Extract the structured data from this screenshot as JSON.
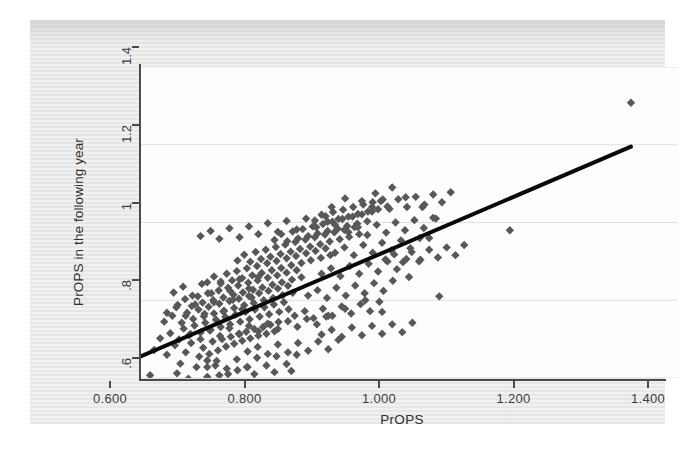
{
  "chart_data": {
    "type": "scatter",
    "title": "",
    "xlabel": "PrOPS",
    "ylabel": "PrOPS in the following year",
    "xlim": [
      0.6,
      1.4
    ],
    "ylim": [
      0.6,
      1.4
    ],
    "grid": true,
    "legend": null,
    "xticks": [
      0.6,
      0.8,
      1.0,
      1.2,
      1.4
    ],
    "xticklabels": [
      "0.600",
      "0.800",
      "1.000",
      "1.200",
      "1.400"
    ],
    "yticks": [
      0.6,
      0.8,
      1.0,
      1.2,
      1.4
    ],
    "yticklabels": [
      ".6",
      ".8",
      "1",
      "1.2",
      "1.4"
    ],
    "marker": "diamond",
    "marker_color": "#58585a",
    "marker_size": 4.2,
    "fit_line": {
      "name": "linear fit",
      "color": "#0a0a0a",
      "width": 4.0,
      "x0": 0.6,
      "y0": 0.655,
      "x1": 1.33,
      "y1": 1.195,
      "slope": 0.7397,
      "intercept": 0.2112
    },
    "points": [
      [
        0.615,
        0.607
      ],
      [
        0.672,
        0.598
      ],
      [
        0.718,
        0.607
      ],
      [
        0.731,
        0.61
      ],
      [
        0.66,
        0.637
      ],
      [
        0.684,
        0.628
      ],
      [
        0.7,
        0.645
      ],
      [
        0.712,
        0.632
      ],
      [
        0.745,
        0.62
      ],
      [
        0.76,
        0.628
      ],
      [
        0.621,
        0.672
      ],
      [
        0.64,
        0.66
      ],
      [
        0.652,
        0.684
      ],
      [
        0.668,
        0.666
      ],
      [
        0.676,
        0.69
      ],
      [
        0.688,
        0.655
      ],
      [
        0.694,
        0.678
      ],
      [
        0.703,
        0.662
      ],
      [
        0.708,
        0.694
      ],
      [
        0.716,
        0.671
      ],
      [
        0.722,
        0.7
      ],
      [
        0.728,
        0.681
      ],
      [
        0.735,
        0.706
      ],
      [
        0.74,
        0.688
      ],
      [
        0.748,
        0.713
      ],
      [
        0.752,
        0.696
      ],
      [
        0.758,
        0.719
      ],
      [
        0.764,
        0.702
      ],
      [
        0.77,
        0.726
      ],
      [
        0.776,
        0.709
      ],
      [
        0.783,
        0.731
      ],
      [
        0.788,
        0.714
      ],
      [
        0.794,
        0.737
      ],
      [
        0.8,
        0.72
      ],
      [
        0.806,
        0.744
      ],
      [
        0.63,
        0.702
      ],
      [
        0.645,
        0.715
      ],
      [
        0.658,
        0.699
      ],
      [
        0.665,
        0.727
      ],
      [
        0.673,
        0.71
      ],
      [
        0.681,
        0.735
      ],
      [
        0.69,
        0.717
      ],
      [
        0.697,
        0.742
      ],
      [
        0.705,
        0.724
      ],
      [
        0.713,
        0.75
      ],
      [
        0.72,
        0.731
      ],
      [
        0.727,
        0.757
      ],
      [
        0.734,
        0.738
      ],
      [
        0.742,
        0.763
      ],
      [
        0.749,
        0.745
      ],
      [
        0.757,
        0.77
      ],
      [
        0.763,
        0.751
      ],
      [
        0.771,
        0.776
      ],
      [
        0.778,
        0.758
      ],
      [
        0.785,
        0.782
      ],
      [
        0.792,
        0.764
      ],
      [
        0.799,
        0.789
      ],
      [
        0.807,
        0.77
      ],
      [
        0.814,
        0.795
      ],
      [
        0.821,
        0.777
      ],
      [
        0.636,
        0.745
      ],
      [
        0.648,
        0.76
      ],
      [
        0.662,
        0.742
      ],
      [
        0.67,
        0.768
      ],
      [
        0.679,
        0.752
      ],
      [
        0.687,
        0.776
      ],
      [
        0.695,
        0.759
      ],
      [
        0.702,
        0.783
      ],
      [
        0.71,
        0.766
      ],
      [
        0.718,
        0.791
      ],
      [
        0.725,
        0.773
      ],
      [
        0.733,
        0.798
      ],
      [
        0.74,
        0.78
      ],
      [
        0.747,
        0.804
      ],
      [
        0.755,
        0.787
      ],
      [
        0.762,
        0.811
      ],
      [
        0.769,
        0.793
      ],
      [
        0.777,
        0.818
      ],
      [
        0.784,
        0.8
      ],
      [
        0.791,
        0.824
      ],
      [
        0.798,
        0.806
      ],
      [
        0.805,
        0.83
      ],
      [
        0.812,
        0.813
      ],
      [
        0.82,
        0.837
      ],
      [
        0.827,
        0.819
      ],
      [
        0.656,
        0.788
      ],
      [
        0.667,
        0.803
      ],
      [
        0.677,
        0.785
      ],
      [
        0.686,
        0.81
      ],
      [
        0.693,
        0.794
      ],
      [
        0.701,
        0.818
      ],
      [
        0.709,
        0.8
      ],
      [
        0.717,
        0.825
      ],
      [
        0.724,
        0.807
      ],
      [
        0.731,
        0.832
      ],
      [
        0.739,
        0.814
      ],
      [
        0.746,
        0.838
      ],
      [
        0.753,
        0.82
      ],
      [
        0.761,
        0.845
      ],
      [
        0.768,
        0.827
      ],
      [
        0.775,
        0.851
      ],
      [
        0.782,
        0.833
      ],
      [
        0.79,
        0.858
      ],
      [
        0.797,
        0.84
      ],
      [
        0.804,
        0.864
      ],
      [
        0.811,
        0.846
      ],
      [
        0.818,
        0.871
      ],
      [
        0.826,
        0.853
      ],
      [
        0.833,
        0.877
      ],
      [
        0.84,
        0.859
      ],
      [
        0.7,
        0.846
      ],
      [
        0.71,
        0.861
      ],
      [
        0.72,
        0.843
      ],
      [
        0.729,
        0.868
      ],
      [
        0.737,
        0.851
      ],
      [
        0.744,
        0.875
      ],
      [
        0.752,
        0.857
      ],
      [
        0.759,
        0.882
      ],
      [
        0.767,
        0.864
      ],
      [
        0.774,
        0.888
      ],
      [
        0.781,
        0.87
      ],
      [
        0.789,
        0.895
      ],
      [
        0.796,
        0.877
      ],
      [
        0.803,
        0.901
      ],
      [
        0.81,
        0.883
      ],
      [
        0.818,
        0.908
      ],
      [
        0.825,
        0.89
      ],
      [
        0.832,
        0.914
      ],
      [
        0.84,
        0.896
      ],
      [
        0.847,
        0.921
      ],
      [
        0.854,
        0.903
      ],
      [
        0.861,
        0.927
      ],
      [
        0.869,
        0.909
      ],
      [
        0.876,
        0.933
      ],
      [
        0.883,
        0.916
      ],
      [
        0.745,
        0.902
      ],
      [
        0.755,
        0.917
      ],
      [
        0.764,
        0.899
      ],
      [
        0.772,
        0.924
      ],
      [
        0.78,
        0.906
      ],
      [
        0.787,
        0.93
      ],
      [
        0.794,
        0.912
      ],
      [
        0.802,
        0.937
      ],
      [
        0.809,
        0.919
      ],
      [
        0.816,
        0.943
      ],
      [
        0.824,
        0.925
      ],
      [
        0.831,
        0.95
      ],
      [
        0.838,
        0.932
      ],
      [
        0.846,
        0.956
      ],
      [
        0.853,
        0.938
      ],
      [
        0.86,
        0.962
      ],
      [
        0.868,
        0.944
      ],
      [
        0.875,
        0.969
      ],
      [
        0.882,
        0.951
      ],
      [
        0.889,
        0.975
      ],
      [
        0.897,
        0.957
      ],
      [
        0.904,
        0.981
      ],
      [
        0.911,
        0.963
      ],
      [
        0.919,
        0.988
      ],
      [
        0.926,
        0.97
      ],
      [
        0.8,
        0.955
      ],
      [
        0.81,
        0.97
      ],
      [
        0.819,
        0.952
      ],
      [
        0.827,
        0.977
      ],
      [
        0.835,
        0.959
      ],
      [
        0.842,
        0.983
      ],
      [
        0.85,
        0.965
      ],
      [
        0.857,
        0.99
      ],
      [
        0.864,
        0.972
      ],
      [
        0.872,
        0.996
      ],
      [
        0.879,
        0.978
      ],
      [
        0.886,
        1.002
      ],
      [
        0.894,
        0.984
      ],
      [
        0.901,
        1.009
      ],
      [
        0.908,
        0.991
      ],
      [
        0.916,
        1.015
      ],
      [
        0.923,
        0.997
      ],
      [
        0.93,
        1.021
      ],
      [
        0.938,
        1.003
      ],
      [
        0.945,
        1.028
      ],
      [
        0.86,
        1.005
      ],
      [
        0.87,
        1.02
      ],
      [
        0.879,
        1.002
      ],
      [
        0.887,
        1.027
      ],
      [
        0.895,
        1.009
      ],
      [
        0.902,
        1.033
      ],
      [
        0.91,
        1.015
      ],
      [
        0.917,
        1.04
      ],
      [
        0.924,
        1.022
      ],
      [
        0.932,
        1.046
      ],
      [
        0.939,
        1.028
      ],
      [
        0.946,
        1.052
      ],
      [
        0.954,
        1.034
      ],
      [
        0.961,
        1.059
      ],
      [
        0.968,
        1.041
      ],
      [
        0.69,
        0.965
      ],
      [
        0.705,
        0.978
      ],
      [
        0.718,
        0.958
      ],
      [
        0.733,
        0.985
      ],
      [
        0.748,
        0.962
      ],
      [
        0.762,
        0.99
      ],
      [
        0.776,
        0.97
      ],
      [
        0.79,
        0.998
      ],
      [
        0.805,
        0.976
      ],
      [
        0.818,
        1.004
      ],
      [
        0.833,
        0.982
      ],
      [
        0.847,
        1.01
      ],
      [
        0.862,
        0.988
      ],
      [
        0.876,
        1.016
      ],
      [
        0.89,
        0.994
      ],
      [
        0.65,
        0.82
      ],
      [
        0.664,
        0.835
      ],
      [
        0.678,
        0.812
      ],
      [
        0.692,
        0.842
      ],
      [
        0.706,
        0.818
      ],
      [
        0.72,
        0.848
      ],
      [
        0.734,
        0.824
      ],
      [
        0.748,
        0.854
      ],
      [
        0.762,
        0.83
      ],
      [
        0.776,
        0.86
      ],
      [
        0.64,
        0.768
      ],
      [
        0.654,
        0.782
      ],
      [
        0.668,
        0.76
      ],
      [
        0.682,
        0.789
      ],
      [
        0.696,
        0.765
      ],
      [
        0.71,
        0.795
      ],
      [
        0.724,
        0.771
      ],
      [
        0.738,
        0.801
      ],
      [
        0.752,
        0.777
      ],
      [
        0.766,
        0.807
      ],
      [
        0.675,
        0.713
      ],
      [
        0.69,
        0.7
      ],
      [
        0.704,
        0.722
      ],
      [
        0.719,
        0.708
      ],
      [
        0.733,
        0.728
      ],
      [
        0.747,
        0.714
      ],
      [
        0.762,
        0.734
      ],
      [
        0.776,
        0.72
      ],
      [
        0.79,
        0.74
      ],
      [
        0.805,
        0.726
      ],
      [
        0.82,
        0.746
      ],
      [
        0.834,
        0.732
      ],
      [
        0.848,
        0.752
      ],
      [
        0.863,
        0.738
      ],
      [
        0.877,
        0.758
      ],
      [
        0.83,
        0.76
      ],
      [
        0.845,
        0.772
      ],
      [
        0.858,
        0.754
      ],
      [
        0.872,
        0.778
      ],
      [
        0.886,
        0.76
      ],
      [
        0.9,
        0.784
      ],
      [
        0.914,
        0.766
      ],
      [
        0.928,
        0.79
      ],
      [
        0.942,
        0.772
      ],
      [
        0.956,
        0.796
      ],
      [
        0.85,
        0.812
      ],
      [
        0.864,
        0.826
      ],
      [
        0.878,
        0.806
      ],
      [
        0.892,
        0.832
      ],
      [
        0.906,
        0.812
      ],
      [
        0.92,
        0.838
      ],
      [
        0.934,
        0.818
      ],
      [
        0.948,
        0.844
      ],
      [
        0.962,
        0.824
      ],
      [
        0.976,
        0.85
      ],
      [
        0.87,
        0.868
      ],
      [
        0.884,
        0.882
      ],
      [
        0.898,
        0.862
      ],
      [
        0.912,
        0.888
      ],
      [
        0.926,
        0.868
      ],
      [
        0.94,
        0.894
      ],
      [
        0.954,
        0.874
      ],
      [
        0.968,
        0.9
      ],
      [
        0.982,
        0.88
      ],
      [
        0.996,
        0.906
      ],
      [
        0.89,
        0.922
      ],
      [
        0.904,
        0.936
      ],
      [
        0.918,
        0.916
      ],
      [
        0.932,
        0.942
      ],
      [
        0.946,
        0.922
      ],
      [
        0.96,
        0.948
      ],
      [
        0.974,
        0.928
      ],
      [
        0.988,
        0.954
      ],
      [
        1.002,
        0.934
      ],
      [
        1.016,
        0.96
      ],
      [
        0.91,
        0.975
      ],
      [
        0.924,
        0.988
      ],
      [
        0.938,
        0.968
      ],
      [
        0.952,
        0.994
      ],
      [
        0.966,
        0.974
      ],
      [
        0.98,
        1.0
      ],
      [
        0.994,
        0.98
      ],
      [
        1.008,
        1.006
      ],
      [
        1.022,
        0.986
      ],
      [
        1.036,
        1.012
      ],
      [
        0.945,
        1.04
      ],
      [
        0.958,
        1.055
      ],
      [
        0.971,
        1.035
      ],
      [
        0.984,
        1.06
      ],
      [
        0.997,
        1.04
      ],
      [
        1.01,
        1.066
      ],
      [
        1.023,
        1.046
      ],
      [
        1.036,
        1.072
      ],
      [
        1.049,
        1.052
      ],
      [
        1.062,
        1.078
      ],
      [
        0.965,
        0.905
      ],
      [
        0.978,
        0.918
      ],
      [
        0.991,
        0.898
      ],
      [
        1.004,
        0.924
      ],
      [
        1.017,
        0.904
      ],
      [
        1.03,
        0.93
      ],
      [
        1.043,
        0.91
      ],
      [
        1.056,
        0.936
      ],
      [
        1.069,
        0.916
      ],
      [
        1.082,
        0.942
      ],
      [
        0.7,
        0.628
      ],
      [
        0.714,
        0.644
      ],
      [
        0.729,
        0.624
      ],
      [
        0.744,
        0.648
      ],
      [
        0.759,
        0.628
      ],
      [
        0.774,
        0.652
      ],
      [
        0.788,
        0.632
      ],
      [
        0.803,
        0.656
      ],
      [
        0.818,
        0.636
      ],
      [
        0.833,
        0.66
      ],
      [
        0.76,
        0.668
      ],
      [
        0.775,
        0.68
      ],
      [
        0.79,
        0.662
      ],
      [
        0.805,
        0.686
      ],
      [
        0.82,
        0.666
      ],
      [
        0.835,
        0.69
      ],
      [
        0.85,
        0.67
      ],
      [
        0.865,
        0.694
      ],
      [
        0.88,
        0.674
      ],
      [
        0.895,
        0.698
      ],
      [
        0.87,
        0.712
      ],
      [
        0.885,
        0.724
      ],
      [
        0.9,
        0.706
      ],
      [
        0.915,
        0.73
      ],
      [
        0.93,
        0.71
      ],
      [
        0.945,
        0.734
      ],
      [
        0.96,
        0.714
      ],
      [
        0.975,
        0.738
      ],
      [
        0.99,
        0.718
      ],
      [
        1.005,
        0.742
      ],
      [
        1.045,
        0.81
      ],
      [
        1.15,
        0.98
      ],
      [
        1.3,
        1.42
      ],
      [
        1.33,
        1.308
      ],
      [
        0.77,
        0.61
      ],
      [
        0.8,
        0.615
      ],
      [
        0.825,
        0.618
      ],
      [
        0.7,
        0.603
      ],
      [
        0.655,
        0.612
      ],
      [
        0.88,
        0.76
      ],
      [
        0.905,
        0.778
      ],
      [
        0.935,
        0.8
      ],
      [
        0.96,
        0.77
      ],
      [
        1.0,
        0.86
      ],
      [
        1.015,
        0.9
      ],
      [
        1.03,
        0.96
      ],
      [
        1.04,
        1.01
      ],
      [
        1.02,
        1.04
      ],
      [
        0.995,
        1.065
      ],
      [
        0.975,
        1.09
      ],
      [
        0.95,
        1.075
      ],
      [
        0.93,
        1.055
      ],
      [
        0.905,
        1.062
      ],
      [
        0.885,
        1.04
      ]
    ]
  }
}
